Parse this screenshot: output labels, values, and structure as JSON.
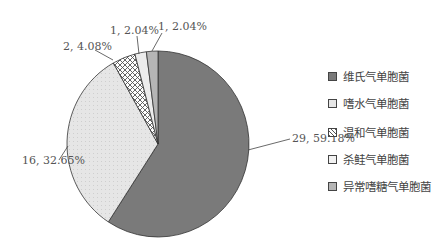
{
  "chart_data": {
    "type": "pie",
    "title": "",
    "categories": [
      "维氏气单胞菌",
      "嗜水气单胞菌",
      "温和气单胞菌",
      "杀鲑气单胞菌",
      "异常嗜糖气单胞菌"
    ],
    "values": [
      29,
      16,
      2,
      1,
      1
    ],
    "percentages": [
      59.18,
      32.65,
      4.08,
      2.04,
      2.04
    ],
    "data_labels": [
      "29, 59.18%",
      "16, 32.65%",
      "2, 4.08%",
      "1, 2.04%",
      "1, 2.04%"
    ],
    "colors": [
      "#7a7a7a",
      "#e4e4e4",
      "#cfcfcf",
      "#ececec",
      "#b5b5b5"
    ],
    "patterns": [
      "solid",
      "light-dots",
      "crosshatch",
      "solid",
      "solid"
    ],
    "legend_position": "right",
    "start_angle": "12 o'clock, clockwise"
  },
  "legend": {
    "items": [
      {
        "label": "维氏气单胞菌"
      },
      {
        "label": "嗜水气单胞菌"
      },
      {
        "label": "温和气单胞菌"
      },
      {
        "label": "杀鲑气单胞菌"
      },
      {
        "label": "异常嗜糖气单胞菌"
      }
    ]
  }
}
